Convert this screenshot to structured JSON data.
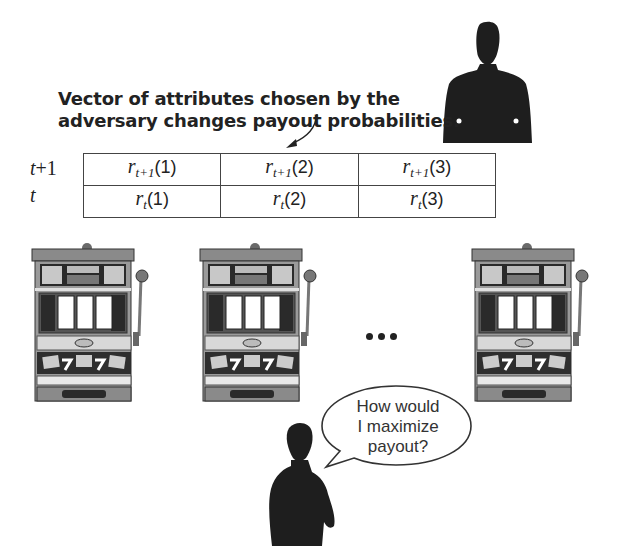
{
  "caption": {
    "line1": "Vector of attributes chosen by the",
    "line2": "adversary changes payout probabilities."
  },
  "table": {
    "rows": [
      {
        "label_var": "t",
        "label_suffix": "+1",
        "cells": [
          {
            "var": "r",
            "sub": "t+1",
            "arg": "(1)"
          },
          {
            "var": "r",
            "sub": "t+1",
            "arg": "(2)"
          },
          {
            "var": "r",
            "sub": "t+1",
            "arg": "(3)"
          }
        ]
      },
      {
        "label_var": "t",
        "label_suffix": "",
        "cells": [
          {
            "var": "r",
            "sub": "t",
            "arg": "(1)"
          },
          {
            "var": "r",
            "sub": "t",
            "arg": "(2)"
          },
          {
            "var": "r",
            "sub": "t",
            "arg": "(3)"
          }
        ]
      }
    ]
  },
  "machines": [
    {
      "name": "slot-machine-1",
      "header": "PAYOUTS",
      "coin": "25¢"
    },
    {
      "name": "slot-machine-2",
      "header": "PAYOUTS",
      "coin": "25¢"
    },
    {
      "name": "slot-machine-3",
      "header": "PAYOUTS",
      "coin": "25¢"
    }
  ],
  "ellipsis": "• • •",
  "speech_bubble": {
    "line1": "How would",
    "line2": "I maximize",
    "line3": "payout?"
  },
  "figures": {
    "adversary": "adversary-silhouette",
    "player": "player-silhouette"
  },
  "colors": {
    "text": "#222222",
    "silhouette": "#1e1e1e",
    "machine_dark": "#3a3a3a",
    "machine_mid": "#8a8a8a",
    "machine_light": "#d8d8d8"
  }
}
